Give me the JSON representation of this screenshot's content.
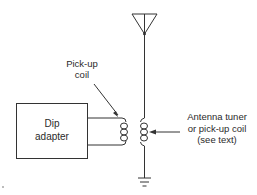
{
  "diagram": {
    "labels": {
      "pickup_coil_line1": "Pick-up",
      "pickup_coil_line2": "coil",
      "dip_adapter_line1": "Dip",
      "dip_adapter_line2": "adapter",
      "antenna_tuner_line1": "Antenna tuner",
      "antenna_tuner_line2": "or pick-up coil",
      "antenna_tuner_line3": "(see text)"
    },
    "components": [
      "antenna",
      "dip-adapter-box",
      "pick-up-coil",
      "antenna-tuner-coil",
      "ground"
    ],
    "colors": {
      "line": "#333333",
      "text": "#2a2a2a",
      "background": "#ffffff"
    }
  }
}
